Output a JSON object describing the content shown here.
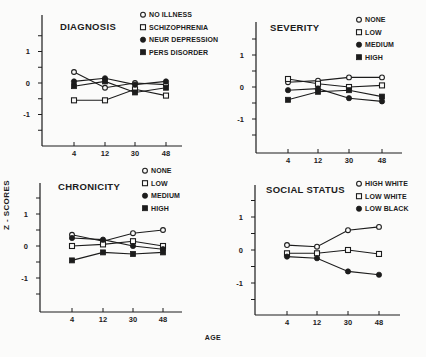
{
  "figure": {
    "ylabel": "Z - SCORES",
    "xlabel": "AGE"
  },
  "chart_data": [
    {
      "type": "line",
      "title": "DIAGNOSIS",
      "xlabel": "AGE",
      "ylabel": "Z - SCORES",
      "categories": [
        "4",
        "12",
        "30",
        "48"
      ],
      "y_tick_labels": [
        "1",
        "0",
        "-1"
      ],
      "ylim": [
        -1.5,
        1.5
      ],
      "legend_position": "top-right",
      "series": [
        {
          "name": "NO ILLNESS",
          "marker": "open-circle",
          "values": [
            0.35,
            -0.15,
            0.0,
            -0.05
          ]
        },
        {
          "name": "SCHIZOPHRENIA",
          "marker": "open-square",
          "values": [
            -0.55,
            -0.55,
            -0.2,
            -0.4
          ]
        },
        {
          "name": "NEUR DEPRESSION",
          "marker": "filled-circle",
          "values": [
            0.05,
            0.15,
            -0.05,
            0.05
          ]
        },
        {
          "name": "PERS DISORDER",
          "marker": "filled-square",
          "values": [
            -0.1,
            0.05,
            -0.3,
            -0.15
          ]
        }
      ]
    },
    {
      "type": "line",
      "title": "SEVERITY",
      "xlabel": "AGE",
      "ylabel": "Z - SCORES",
      "categories": [
        "4",
        "12",
        "30",
        "48"
      ],
      "y_tick_labels": [
        "1",
        "0",
        "-1"
      ],
      "ylim": [
        -1.5,
        1.5
      ],
      "legend_position": "top-right",
      "series": [
        {
          "name": "NONE",
          "marker": "open-circle",
          "values": [
            0.15,
            0.2,
            0.3,
            0.3
          ]
        },
        {
          "name": "LOW",
          "marker": "open-square",
          "values": [
            0.25,
            0.1,
            0.0,
            0.05
          ]
        },
        {
          "name": "MEDIUM",
          "marker": "filled-circle",
          "values": [
            -0.1,
            -0.05,
            -0.35,
            -0.45
          ]
        },
        {
          "name": "HIGH",
          "marker": "filled-square",
          "values": [
            -0.4,
            -0.15,
            -0.1,
            -0.3
          ]
        }
      ]
    },
    {
      "type": "line",
      "title": "CHRONICITY",
      "xlabel": "AGE",
      "ylabel": "Z - SCORES",
      "categories": [
        "4",
        "12",
        "30",
        "48"
      ],
      "y_tick_labels": [
        "1",
        "0",
        "-1"
      ],
      "ylim": [
        -1.5,
        1.5
      ],
      "legend_position": "top-right",
      "series": [
        {
          "name": "NONE",
          "marker": "open-circle",
          "values": [
            0.35,
            0.15,
            0.4,
            0.5
          ]
        },
        {
          "name": "LOW",
          "marker": "open-square",
          "values": [
            0.0,
            0.05,
            0.15,
            0.0
          ]
        },
        {
          "name": "MEDIUM",
          "marker": "filled-circle",
          "values": [
            0.25,
            0.2,
            0.0,
            -0.1
          ]
        },
        {
          "name": "HIGH",
          "marker": "filled-square",
          "values": [
            -0.45,
            -0.2,
            -0.25,
            -0.2
          ]
        }
      ]
    },
    {
      "type": "line",
      "title": "SOCIAL STATUS",
      "xlabel": "AGE",
      "ylabel": "Z - SCORES",
      "categories": [
        "4",
        "12",
        "30",
        "48"
      ],
      "y_tick_labels": [
        "1",
        "0",
        "-1"
      ],
      "ylim": [
        -1.5,
        1.5
      ],
      "legend_position": "top-right",
      "series": [
        {
          "name": "HIGH WHITE",
          "marker": "open-circle",
          "values": [
            0.15,
            0.1,
            0.6,
            0.7
          ]
        },
        {
          "name": "LOW WHITE",
          "marker": "open-square",
          "values": [
            -0.1,
            -0.1,
            0.0,
            -0.12
          ]
        },
        {
          "name": "LOW BLACK",
          "marker": "filled-circle",
          "values": [
            -0.2,
            -0.25,
            -0.65,
            -0.75
          ]
        }
      ]
    }
  ]
}
